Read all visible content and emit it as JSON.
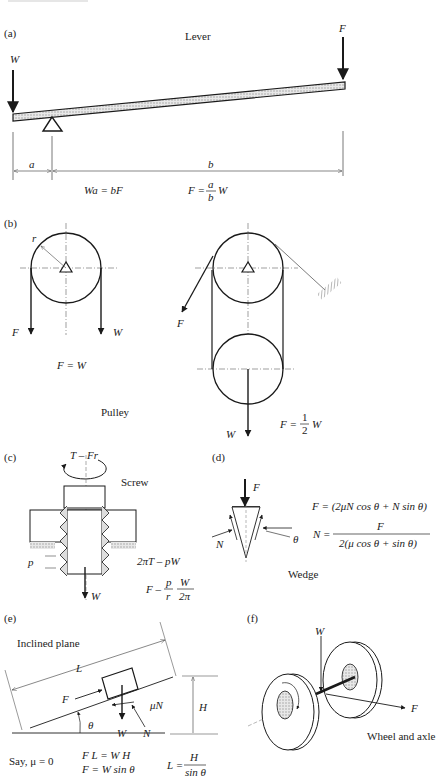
{
  "panels": {
    "a": {
      "label": "(a)",
      "title": "Lever",
      "force_left": "W",
      "force_right": "F",
      "dim_a": "a",
      "dim_b": "b",
      "eq1": "Wa = bF",
      "eq2_lhs": "F =",
      "eq2_num": "a",
      "eq2_den": "b",
      "eq2_rhs": "W"
    },
    "b": {
      "label": "(b)",
      "title": "Pulley",
      "radius": "r",
      "single_F": "F",
      "single_W": "W",
      "single_eq": "F = W",
      "double_F": "F",
      "double_W": "W",
      "double_eq_lhs": "F =",
      "double_eq_num": "1",
      "double_eq_den": "2",
      "double_eq_rhs": "W"
    },
    "c": {
      "label": "(c)",
      "title": "Screw",
      "torque": "T – Fr",
      "pitch": "p",
      "load": "W",
      "eq1": "2πT – pW",
      "eq2_lhs": "F –",
      "eq2_p_num": "p",
      "eq2_p_den": "r",
      "eq2_w_num": "W",
      "eq2_w_den": "2π"
    },
    "d": {
      "label": "(d)",
      "title": "Wedge",
      "force": "F",
      "normal": "N",
      "angle": "θ",
      "eq1": "F = (2μN cos θ + N sin θ)",
      "eq2_lhs": "N =",
      "eq2_num": "F",
      "eq2_den": "2(μ cos θ + sin θ)"
    },
    "e": {
      "label": "(e)",
      "title": "Inclined plane",
      "length": "L",
      "force": "F",
      "friction": "μN",
      "height": "H",
      "angle": "θ",
      "weight": "W",
      "normal": "N",
      "assume": "Say, μ = 0",
      "eq1": "F L = W H",
      "eq2": "F = W sin θ",
      "eq3_lhs": "L =",
      "eq3_num": "H",
      "eq3_den": "sin θ"
    },
    "f": {
      "label": "(f)",
      "title": "Wheel and axle",
      "weight": "W",
      "force": "F"
    }
  },
  "colors": {
    "line": "#1a1a1a",
    "hatch": "#9a9a9a",
    "dash": "#777777"
  }
}
